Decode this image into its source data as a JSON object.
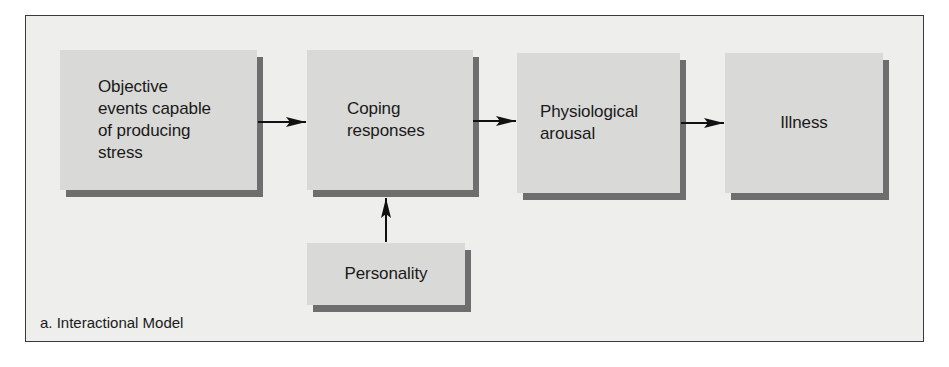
{
  "figure": {
    "caption": "a. Interactional Model",
    "nodes": [
      {
        "id": "objective-events",
        "label": "Objective\nevents capable\nof producing\nstress"
      },
      {
        "id": "coping-responses",
        "label": "Coping\nresponses"
      },
      {
        "id": "physiological-arousal",
        "label": "Physiological\narousal"
      },
      {
        "id": "illness",
        "label": "Illness"
      },
      {
        "id": "personality",
        "label": "Personality"
      }
    ],
    "edges": [
      {
        "from": "objective-events",
        "to": "coping-responses"
      },
      {
        "from": "coping-responses",
        "to": "physiological-arousal"
      },
      {
        "from": "physiological-arousal",
        "to": "illness"
      },
      {
        "from": "personality",
        "to": "coping-responses"
      }
    ]
  },
  "colors": {
    "frame_background": "#eeeeec",
    "box_fill": "#d9d9d7",
    "box_shadow": "#6e6e6e",
    "arrow": "#111111",
    "text": "#1a1a1a"
  }
}
